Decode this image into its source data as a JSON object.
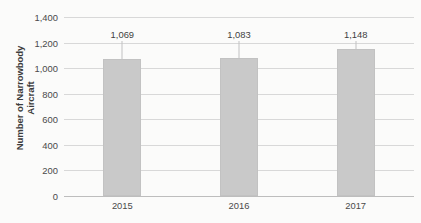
{
  "chart_data": {
    "type": "bar",
    "title": "",
    "subtitle": "",
    "xlabel": "",
    "ylabel": "Number of Narrowbody\nAircraft",
    "categories": [
      "2015",
      "2016",
      "2017"
    ],
    "values": [
      1069,
      1083,
      1148
    ],
    "data_labels": [
      "1,069",
      "1,083",
      "1,148"
    ],
    "ylim": [
      0,
      1400
    ],
    "ytick_values": [
      1400,
      1200,
      1000,
      800,
      600,
      400,
      200,
      0
    ],
    "ytick_labels": [
      "1,400",
      "1,200",
      "1,000",
      "800",
      "600",
      "400",
      "200",
      "0"
    ],
    "grid": true,
    "legend": false,
    "legend_position": "none",
    "series": [
      {
        "name": "Number of Narrowbody Aircraft",
        "values": [
          1069,
          1083,
          1148
        ],
        "color": "#c9c9c9"
      }
    ],
    "colors": {
      "bar_fill": "#c9c9c9",
      "bar_border": "#c2c2c2",
      "gridline": "#d8d8d8",
      "axis_line": "#bdbdbd",
      "text": "#4a4a4a",
      "background": "#fbfbfa"
    }
  }
}
